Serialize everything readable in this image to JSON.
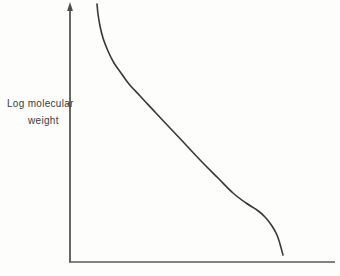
{
  "figure": {
    "background": "#fdfdfc",
    "ink_color": "#3a3a3a",
    "axis_color": "#4c4c4c"
  },
  "chart_data": {
    "type": "line",
    "title": "",
    "xlabel": "",
    "ylabel": "Log molecular weight",
    "ylabel_lines": [
      "Log molecular",
      "weight"
    ],
    "legend": null,
    "grid": false,
    "axis_numeric_labels_shown": false,
    "x_axis": {
      "y_px": 262,
      "x_start_px": 70,
      "x_end_px": 335,
      "ticks": []
    },
    "y_axis": {
      "x_px": 70,
      "y_bottom_px": 262,
      "y_top_px": 4,
      "arrowhead": true,
      "tick_y_px": [
        104
      ],
      "tick_length_px": 3.5
    },
    "curve": {
      "color": "#383838",
      "stroke_width": 1.6,
      "points_px": [
        [
          97,
          4
        ],
        [
          98,
          14
        ],
        [
          100,
          26
        ],
        [
          103,
          38
        ],
        [
          108,
          51
        ],
        [
          114,
          63
        ],
        [
          121,
          73
        ],
        [
          129,
          84
        ],
        [
          141,
          97
        ],
        [
          155,
          112
        ],
        [
          170,
          128
        ],
        [
          186,
          145
        ],
        [
          202,
          162
        ],
        [
          218,
          178
        ],
        [
          233,
          193
        ],
        [
          246,
          203
        ],
        [
          257,
          210
        ],
        [
          265,
          217
        ],
        [
          272,
          226
        ],
        [
          277,
          235
        ],
        [
          280,
          244
        ],
        [
          283,
          255
        ]
      ]
    }
  }
}
